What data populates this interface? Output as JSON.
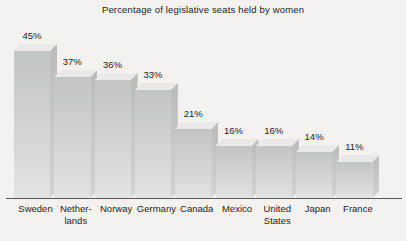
{
  "chart_data": {
    "type": "bar",
    "title": "Percentage of legislative seats held by women",
    "xlabel": "",
    "ylabel": "",
    "ylim": [
      0,
      50
    ],
    "grid": false,
    "legend": null,
    "value_suffix": "%",
    "categories": [
      "Sweden",
      "Netherlands",
      "Norway",
      "Germany",
      "Canada",
      "Mexico",
      "United States",
      "Japan",
      "France"
    ],
    "category_label_lines": [
      [
        "Sweden"
      ],
      [
        "Nether-",
        "lands"
      ],
      [
        "Norway"
      ],
      [
        "Germany"
      ],
      [
        "Canada"
      ],
      [
        "Mexico"
      ],
      [
        "United",
        "States"
      ],
      [
        "Japan"
      ],
      [
        "France"
      ]
    ],
    "values": [
      45,
      37,
      36,
      33,
      21,
      16,
      16,
      14,
      11
    ],
    "value_labels": [
      "45%",
      "37%",
      "36%",
      "33%",
      "21%",
      "16%",
      "16%",
      "14%",
      "11%"
    ],
    "style": {
      "background": "#f3f2f0",
      "bar_front": "#cdcecd",
      "bar_side": "#c2c3c2",
      "bar_top": "#e8e9e8",
      "axis": "#5a5a5a",
      "text": "#1c1c1c"
    }
  }
}
